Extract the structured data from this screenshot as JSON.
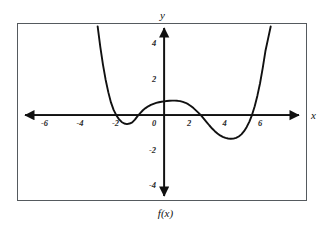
{
  "figure": {
    "function_label": "f(x)",
    "x_axis_name": "x",
    "y_axis_name": "y",
    "frame_color": "#555a5e",
    "grid_color": "#d8dce2",
    "curve_color": "#111111",
    "axis_color": "#111111"
  },
  "chart_data": {
    "type": "line",
    "title": "",
    "subtitle": "",
    "xlabel": "x",
    "ylabel": "y",
    "function_label": "f(x)",
    "xlim": [
      -8.2,
      8.2
    ],
    "ylim": [
      -5.0,
      5.0
    ],
    "grid": true,
    "grid_step_x": 1,
    "grid_step_y": 1,
    "legend": "none",
    "x_ticks": [
      -6,
      -4,
      -2,
      0,
      2,
      4,
      6
    ],
    "x_tick_labels": [
      "-6",
      "-4",
      "-2",
      "0",
      "2",
      "4",
      "6"
    ],
    "y_ticks": [
      -4,
      -2,
      2,
      4
    ],
    "y_tick_labels": [
      "-4",
      "-2",
      "2",
      "4"
    ],
    "axis_arrows": [
      "left",
      "right",
      "up",
      "down"
    ],
    "series": [
      {
        "name": "f(x)",
        "roots": [
          -2.9,
          -1.5,
          2.1,
          5.2
        ],
        "local_minima": [
          [
            -2.2,
            -0.5
          ],
          [
            4.0,
            -1.3
          ]
        ],
        "local_maxima": [
          [
            0.7,
            0.8
          ]
        ],
        "y_intercept": 0.65,
        "x": [
          -3.75,
          -3.6,
          -3.45,
          -3.3,
          -3.15,
          -3.0,
          -2.85,
          -2.7,
          -2.55,
          -2.4,
          -2.25,
          -2.1,
          -1.95,
          -1.8,
          -1.65,
          -1.5,
          -1.35,
          -1.2,
          -1.05,
          -0.9,
          -0.75,
          -0.6,
          -0.45,
          -0.3,
          -0.15,
          0.0,
          0.15,
          0.3,
          0.45,
          0.6,
          0.75,
          0.9,
          1.05,
          1.2,
          1.35,
          1.5,
          1.65,
          1.8,
          1.95,
          2.1,
          2.25,
          2.4,
          2.55,
          2.7,
          2.85,
          3.0,
          3.15,
          3.3,
          3.45,
          3.6,
          3.75,
          3.9,
          4.05,
          4.2,
          4.35,
          4.5,
          4.65,
          4.8,
          4.95,
          5.1,
          5.25,
          5.4,
          5.55,
          5.7,
          5.85,
          6.0
        ],
        "y": [
          5.0,
          3.85,
          2.85,
          2.0,
          1.3,
          0.72,
          0.3,
          0.0,
          -0.22,
          -0.38,
          -0.47,
          -0.5,
          -0.47,
          -0.4,
          -0.25,
          -0.05,
          0.12,
          0.28,
          0.4,
          0.5,
          0.58,
          0.64,
          0.69,
          0.73,
          0.76,
          0.78,
          0.8,
          0.81,
          0.82,
          0.82,
          0.81,
          0.79,
          0.75,
          0.7,
          0.62,
          0.52,
          0.4,
          0.26,
          0.12,
          -0.04,
          -0.22,
          -0.4,
          -0.58,
          -0.75,
          -0.9,
          -1.03,
          -1.14,
          -1.22,
          -1.28,
          -1.31,
          -1.33,
          -1.32,
          -1.28,
          -1.2,
          -1.08,
          -0.9,
          -0.66,
          -0.36,
          0.02,
          0.5,
          1.1,
          1.8,
          2.65,
          3.6,
          4.3,
          5.0
        ]
      }
    ]
  },
  "ticks": {
    "x": [
      {
        "label": "-6",
        "value": -6
      },
      {
        "label": "-4",
        "value": -4
      },
      {
        "label": "-2",
        "value": -2
      },
      {
        "label": "0",
        "value": 0
      },
      {
        "label": "2",
        "value": 2
      },
      {
        "label": "4",
        "value": 4
      },
      {
        "label": "6",
        "value": 6
      }
    ],
    "y": [
      {
        "label": "4",
        "value": 4
      },
      {
        "label": "2",
        "value": 2
      },
      {
        "label": "-2",
        "value": -2
      },
      {
        "label": "-4",
        "value": -4
      }
    ]
  }
}
